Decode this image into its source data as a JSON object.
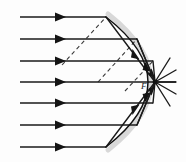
{
  "figure": {
    "type": "optics-ray-diagram",
    "canvas": {
      "width": 186,
      "height": 162,
      "background": "#fdfdfd"
    },
    "colors": {
      "ray": "#1a1a1a",
      "reflected_ray": "#1a1a1a",
      "normal_dashed": "#3a3a3a",
      "mirror": "#111111",
      "mirror_shadow": "#d8d8d8",
      "label": "#1c1c1c"
    },
    "focus": {
      "label": "F",
      "x": 155,
      "y": 82,
      "label_x": 141,
      "label_y": 89
    },
    "mirror": {
      "shape": "parabola",
      "opens": "left",
      "vertex": {
        "x": 176,
        "y": 82
      },
      "top_end": {
        "x": 106,
        "y": 17
      },
      "bottom_end": {
        "x": 106,
        "y": 147
      }
    },
    "incident_rays": [
      {
        "id": "ray-1",
        "y": 17,
        "x_start": 20,
        "x_end": 106,
        "arrow_x": 61
      },
      {
        "id": "ray-2",
        "y": 39,
        "x_start": 20,
        "x_end": 137,
        "arrow_x": 61
      },
      {
        "id": "ray-3",
        "y": 61,
        "x_start": 20,
        "x_end": 153,
        "arrow_x": 61
      },
      {
        "id": "ray-4",
        "y": 82,
        "x_start": 20,
        "x_end": 176,
        "arrow_x": 61
      },
      {
        "id": "ray-5",
        "y": 103,
        "x_start": 20,
        "x_end": 153,
        "arrow_x": 61
      },
      {
        "id": "ray-6",
        "y": 125,
        "x_start": 20,
        "x_end": 137,
        "arrow_x": 61
      },
      {
        "id": "ray-7",
        "y": 147,
        "x_start": 20,
        "x_end": 106,
        "arrow_x": 61
      }
    ],
    "reflected_rays": [
      {
        "id": "reflect-1",
        "from_x": 106,
        "from_y": 17,
        "to_x": 155,
        "to_y": 82,
        "arrow_t": 0.62
      },
      {
        "id": "reflect-2",
        "from_x": 137,
        "from_y": 39,
        "to_x": 155,
        "to_y": 82,
        "arrow_t": 0.58
      },
      {
        "id": "reflect-3",
        "from_x": 153,
        "from_y": 61,
        "to_x": 155,
        "to_y": 82,
        "arrow_t": 0.55
      },
      {
        "id": "reflect-4",
        "from_x": 153,
        "from_y": 103,
        "to_x": 155,
        "to_y": 82,
        "arrow_t": 0.55
      },
      {
        "id": "reflect-5",
        "from_x": 137,
        "from_y": 125,
        "to_x": 155,
        "to_y": 82,
        "arrow_t": 0.58
      },
      {
        "id": "reflect-6",
        "from_x": 106,
        "from_y": 147,
        "to_x": 155,
        "to_y": 82,
        "arrow_t": 0.62
      }
    ],
    "converged_rays": [
      {
        "id": "converge-1",
        "from_x": 155,
        "from_y": 82,
        "to_x": 176,
        "to_y": 70
      },
      {
        "id": "converge-2",
        "from_x": 155,
        "from_y": 82,
        "to_x": 176,
        "to_y": 94
      },
      {
        "id": "converge-3",
        "from_x": 155,
        "from_y": 82,
        "to_x": 170,
        "to_y": 58
      },
      {
        "id": "converge-4",
        "from_x": 155,
        "from_y": 82,
        "to_x": 170,
        "to_y": 106
      },
      {
        "id": "converge-5",
        "from_x": 155,
        "from_y": 82,
        "to_x": 137,
        "to_y": 39
      },
      {
        "id": "converge-6",
        "from_x": 155,
        "from_y": 82,
        "to_x": 137,
        "to_y": 125
      },
      {
        "id": "converge-7",
        "from_x": 155,
        "from_y": 82,
        "to_x": 176,
        "to_y": 82
      }
    ],
    "normals": [
      {
        "id": "normal-1",
        "x1": 62,
        "y1": 65,
        "x2": 106,
        "y2": 17
      },
      {
        "id": "normal-2",
        "x1": 98,
        "y1": 82,
        "x2": 137,
        "y2": 39
      },
      {
        "id": "normal-3",
        "x1": 125,
        "y1": 91,
        "x2": 153,
        "y2": 61
      }
    ]
  }
}
